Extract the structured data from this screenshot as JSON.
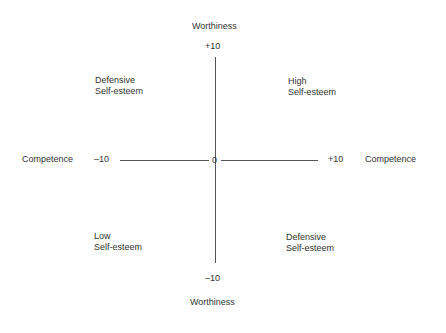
{
  "axes": {
    "y_title_top": "Worthiness",
    "y_title_bottom": "Worthiness",
    "x_title_left": "Competence",
    "x_title_right": "Competence",
    "y_max": "+10",
    "y_min": "–10",
    "x_min": "–10",
    "x_max": "+10",
    "origin": "0"
  },
  "quadrants": {
    "top_left": "Defensive\nSelf-esteem",
    "top_right": "High\nSelf-esteem",
    "bottom_left": "Low\nSelf-esteem",
    "bottom_right": "Defensive\nSelf-esteem"
  },
  "colors": {
    "line": "#555555",
    "text": "#333333"
  }
}
